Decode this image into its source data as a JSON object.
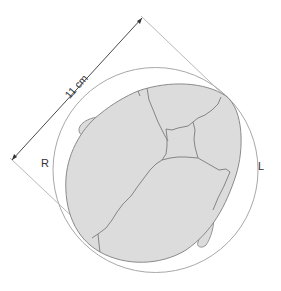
{
  "diagram": {
    "measurement": {
      "label": "11 cm"
    },
    "sides": {
      "left": "R",
      "right": "L"
    },
    "colors": {
      "background": "#ffffff",
      "fill": "#dcdcdc",
      "outline": "#8a8a8a",
      "suture": "#7a7a7a",
      "guide": "#a8a8a8",
      "text": "#333333"
    }
  }
}
